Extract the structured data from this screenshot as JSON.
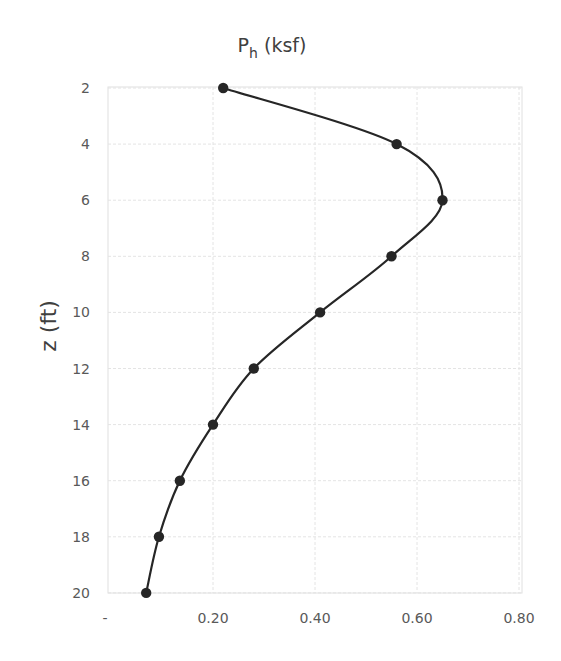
{
  "chart_data": {
    "type": "line",
    "title_main": "P",
    "title_sub": "h",
    "title_unit": " (ksf)",
    "title": "Ph (ksf)",
    "xlabel": "Ph (ksf)",
    "ylabel": "z (ft)",
    "x_axis_position": "bottom",
    "y_axis_inverted": true,
    "xlim": [
      0,
      0.8
    ],
    "ylim": [
      2,
      20
    ],
    "x_ticks": [
      "-",
      "0.20",
      "0.40",
      "0.60",
      "0.80"
    ],
    "x_tick_values": [
      0,
      0.2,
      0.4,
      0.6,
      0.8
    ],
    "y_ticks": [
      "2",
      "4",
      "6",
      "8",
      "10",
      "12",
      "14",
      "16",
      "18",
      "20"
    ],
    "y_tick_values": [
      2,
      4,
      6,
      8,
      10,
      12,
      14,
      16,
      18,
      20
    ],
    "grid": true,
    "legend": null,
    "series": [
      {
        "name": "Ph",
        "color": "#262626",
        "marker": "circle",
        "smooth": true,
        "z": [
          2,
          4,
          6,
          8,
          10,
          12,
          14,
          16,
          18,
          20
        ],
        "values": [
          0.22,
          0.56,
          0.65,
          0.55,
          0.41,
          0.28,
          0.2,
          0.135,
          0.094,
          0.069
        ]
      }
    ]
  }
}
